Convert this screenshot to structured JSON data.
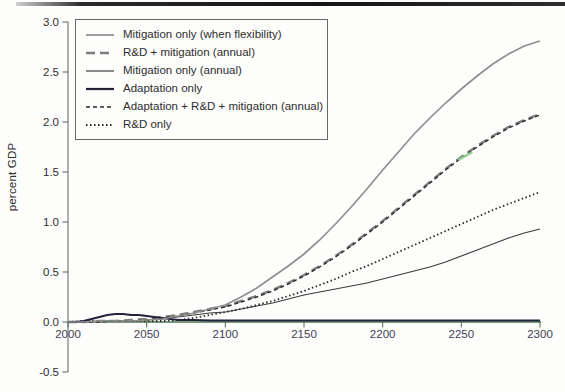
{
  "figure": {
    "background": "#fdfdfc",
    "top_rule_color": "#141414"
  },
  "chart_data": {
    "type": "line",
    "title": "",
    "xlabel": "",
    "ylabel": "percent GDP",
    "xlim": [
      2000,
      2300
    ],
    "ylim": [
      -0.5,
      3.0
    ],
    "x_ticks": [
      2000,
      2050,
      2100,
      2150,
      2200,
      2250,
      2300
    ],
    "y_ticks": [
      -0.5,
      0.0,
      0.5,
      1.0,
      1.5,
      2.0,
      2.5,
      3.0
    ],
    "grid": false,
    "legend_position": "top-left",
    "colors": {
      "x_axis": "#4d7550",
      "y_axis": "#606060",
      "x_tick": "#4d6b4f",
      "x_tick_label": "#3f3f55",
      "y_tick_label": "#2e2e2e",
      "green_artifact": "#8fcf8f"
    },
    "legend": [
      {
        "label": "Mitigation only (when flexibility)",
        "series": "mitigation_flex"
      },
      {
        "label": "R&D + mitigation (annual)",
        "series": "rd_mitigation"
      },
      {
        "label": "Mitigation only (annual)",
        "series": "mitigation_annual"
      },
      {
        "label": "Adaptation only",
        "series": "adaptation_only"
      },
      {
        "label": "Adaptation + R&D + mitigation (annual)",
        "series": "adaptation_rd_mitigation"
      },
      {
        "label": "R&D only",
        "series": "rd_only"
      }
    ],
    "series": [
      {
        "id": "rd_only",
        "name": "R&D only",
        "stroke": "#2a2a2a",
        "width": 1.8,
        "dash": "1.5 2.5",
        "points": [
          [
            2000,
            0.0
          ],
          [
            2010,
            0.01
          ],
          [
            2020,
            0.01
          ],
          [
            2030,
            0.01
          ],
          [
            2040,
            0.01
          ],
          [
            2050,
            0.01
          ],
          [
            2060,
            0.01
          ],
          [
            2070,
            0.02
          ],
          [
            2080,
            0.04
          ],
          [
            2090,
            0.07
          ],
          [
            2100,
            0.1
          ],
          [
            2110,
            0.13
          ],
          [
            2120,
            0.17
          ],
          [
            2130,
            0.21
          ],
          [
            2140,
            0.26
          ],
          [
            2150,
            0.31
          ],
          [
            2160,
            0.37
          ],
          [
            2170,
            0.43
          ],
          [
            2180,
            0.5
          ],
          [
            2190,
            0.56
          ],
          [
            2200,
            0.63
          ],
          [
            2210,
            0.7
          ],
          [
            2220,
            0.77
          ],
          [
            2230,
            0.84
          ],
          [
            2240,
            0.91
          ],
          [
            2250,
            0.98
          ],
          [
            2260,
            1.05
          ],
          [
            2270,
            1.12
          ],
          [
            2280,
            1.18
          ],
          [
            2290,
            1.24
          ],
          [
            2300,
            1.3
          ]
        ]
      },
      {
        "id": "mitigation_annual",
        "name": "Mitigation only (annual)",
        "stroke": "#3c3c3c",
        "width": 1.2,
        "dash": "",
        "points": [
          [
            2000,
            0.0
          ],
          [
            2010,
            0.0
          ],
          [
            2020,
            0.01
          ],
          [
            2030,
            0.01
          ],
          [
            2040,
            0.01
          ],
          [
            2050,
            0.02
          ],
          [
            2060,
            0.03
          ],
          [
            2070,
            0.05
          ],
          [
            2080,
            0.07
          ],
          [
            2090,
            0.09
          ],
          [
            2100,
            0.1
          ],
          [
            2110,
            0.13
          ],
          [
            2120,
            0.16
          ],
          [
            2130,
            0.19
          ],
          [
            2140,
            0.23
          ],
          [
            2150,
            0.27
          ],
          [
            2160,
            0.3
          ],
          [
            2170,
            0.33
          ],
          [
            2180,
            0.36
          ],
          [
            2190,
            0.39
          ],
          [
            2200,
            0.43
          ],
          [
            2210,
            0.47
          ],
          [
            2220,
            0.51
          ],
          [
            2230,
            0.55
          ],
          [
            2240,
            0.6
          ],
          [
            2250,
            0.66
          ],
          [
            2260,
            0.72
          ],
          [
            2270,
            0.78
          ],
          [
            2280,
            0.84
          ],
          [
            2290,
            0.89
          ],
          [
            2300,
            0.93
          ]
        ]
      },
      {
        "id": "rd_mitigation",
        "name": "R&D + mitigation (annual)",
        "stroke": "#7d7d7d",
        "width": 2.4,
        "dash": "9 5",
        "points": [
          [
            2000,
            0.0
          ],
          [
            2010,
            0.0
          ],
          [
            2020,
            0.01
          ],
          [
            2030,
            0.01
          ],
          [
            2040,
            0.02
          ],
          [
            2050,
            0.03
          ],
          [
            2060,
            0.05
          ],
          [
            2070,
            0.07
          ],
          [
            2080,
            0.1
          ],
          [
            2090,
            0.13
          ],
          [
            2100,
            0.16
          ],
          [
            2110,
            0.21
          ],
          [
            2120,
            0.26
          ],
          [
            2130,
            0.32
          ],
          [
            2140,
            0.39
          ],
          [
            2150,
            0.47
          ],
          [
            2160,
            0.56
          ],
          [
            2170,
            0.66
          ],
          [
            2180,
            0.77
          ],
          [
            2190,
            0.89
          ],
          [
            2200,
            1.01
          ],
          [
            2210,
            1.14
          ],
          [
            2220,
            1.27
          ],
          [
            2230,
            1.4
          ],
          [
            2240,
            1.53
          ],
          [
            2250,
            1.65
          ],
          [
            2260,
            1.76
          ],
          [
            2270,
            1.86
          ],
          [
            2280,
            1.95
          ],
          [
            2290,
            2.02
          ],
          [
            2300,
            2.08
          ]
        ]
      },
      {
        "id": "adaptation_rd_mitigation",
        "name": "Adaptation + R&D + mitigation (annual)",
        "stroke": "#2a2a2a",
        "width": 1.4,
        "dash": "4 3",
        "points": [
          [
            2000,
            0.0
          ],
          [
            2010,
            0.0
          ],
          [
            2020,
            0.0
          ],
          [
            2030,
            0.01
          ],
          [
            2040,
            0.01
          ],
          [
            2050,
            0.02
          ],
          [
            2060,
            0.04
          ],
          [
            2070,
            0.06
          ],
          [
            2080,
            0.09
          ],
          [
            2090,
            0.12
          ],
          [
            2100,
            0.15
          ],
          [
            2110,
            0.2
          ],
          [
            2120,
            0.25
          ],
          [
            2130,
            0.31
          ],
          [
            2140,
            0.38
          ],
          [
            2150,
            0.46
          ],
          [
            2160,
            0.55
          ],
          [
            2170,
            0.65
          ],
          [
            2180,
            0.76
          ],
          [
            2190,
            0.88
          ],
          [
            2200,
            1.0
          ],
          [
            2210,
            1.13
          ],
          [
            2220,
            1.26
          ],
          [
            2230,
            1.39
          ],
          [
            2240,
            1.52
          ],
          [
            2250,
            1.64
          ],
          [
            2260,
            1.75
          ],
          [
            2270,
            1.85
          ],
          [
            2280,
            1.94
          ],
          [
            2290,
            2.01
          ],
          [
            2300,
            2.07
          ]
        ]
      },
      {
        "id": "adaptation_only",
        "name": "Adaptation only",
        "stroke": "#23233c",
        "width": 2.2,
        "dash": "",
        "points": [
          [
            2000,
            0.0
          ],
          [
            2005,
            0.0
          ],
          [
            2010,
            0.01
          ],
          [
            2015,
            0.03
          ],
          [
            2020,
            0.05
          ],
          [
            2025,
            0.07
          ],
          [
            2030,
            0.08
          ],
          [
            2035,
            0.08
          ],
          [
            2040,
            0.07
          ],
          [
            2045,
            0.07
          ],
          [
            2050,
            0.06
          ],
          [
            2055,
            0.05
          ],
          [
            2060,
            0.04
          ],
          [
            2065,
            0.03
          ],
          [
            2070,
            0.02
          ],
          [
            2080,
            0.02
          ],
          [
            2090,
            0.015
          ],
          [
            2100,
            0.015
          ],
          [
            2125,
            0.015
          ],
          [
            2150,
            0.015
          ],
          [
            2175,
            0.015
          ],
          [
            2200,
            0.015
          ],
          [
            2225,
            0.015
          ],
          [
            2250,
            0.015
          ],
          [
            2275,
            0.015
          ],
          [
            2300,
            0.015
          ]
        ]
      },
      {
        "id": "mitigation_flex",
        "name": "Mitigation only (when flexibility)",
        "stroke": "#8f8f8f",
        "width": 1.7,
        "dash": "",
        "points": [
          [
            2000,
            0.0
          ],
          [
            2010,
            0.0
          ],
          [
            2020,
            0.01
          ],
          [
            2030,
            0.01
          ],
          [
            2040,
            0.01
          ],
          [
            2050,
            0.02
          ],
          [
            2060,
            0.03
          ],
          [
            2070,
            0.06
          ],
          [
            2080,
            0.09
          ],
          [
            2090,
            0.13
          ],
          [
            2100,
            0.17
          ],
          [
            2110,
            0.25
          ],
          [
            2120,
            0.34
          ],
          [
            2130,
            0.45
          ],
          [
            2140,
            0.56
          ],
          [
            2150,
            0.68
          ],
          [
            2160,
            0.82
          ],
          [
            2170,
            0.98
          ],
          [
            2180,
            1.15
          ],
          [
            2190,
            1.33
          ],
          [
            2200,
            1.52
          ],
          [
            2210,
            1.7
          ],
          [
            2220,
            1.88
          ],
          [
            2230,
            2.04
          ],
          [
            2240,
            2.19
          ],
          [
            2250,
            2.33
          ],
          [
            2260,
            2.46
          ],
          [
            2270,
            2.58
          ],
          [
            2280,
            2.68
          ],
          [
            2290,
            2.76
          ],
          [
            2300,
            2.81
          ]
        ]
      }
    ],
    "annotations": [
      {
        "type": "scan-green-segment",
        "x1": 2248,
        "v1": 1.62,
        "x2": 2257,
        "v2": 1.7,
        "color": "#8fcf8f",
        "width": 2.5
      }
    ]
  }
}
